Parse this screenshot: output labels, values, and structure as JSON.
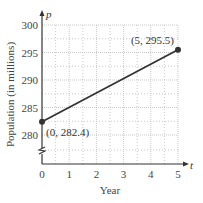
{
  "chart_data": {
    "type": "line",
    "title": "",
    "xlabel": "Year",
    "ylabel": "Population (in millions)",
    "x_axis_var": "t",
    "y_axis_var": "p",
    "xlim": [
      0,
      5
    ],
    "ylim": [
      280,
      300
    ],
    "y_axis_break": true,
    "grid": true,
    "x_ticks": [
      "0",
      "1",
      "2",
      "3",
      "4",
      "5"
    ],
    "y_ticks": [
      "280",
      "285",
      "290",
      "295",
      "300"
    ],
    "series": [
      {
        "name": "Population",
        "points": [
          {
            "x": 0,
            "y": 282.4,
            "label": "(0, 282.4)"
          },
          {
            "x": 5,
            "y": 295.5,
            "label": "(5, 295.5)"
          }
        ]
      }
    ],
    "colors": {
      "line": "#333333",
      "grid": "#bbbbbb",
      "axis": "#333333"
    }
  }
}
